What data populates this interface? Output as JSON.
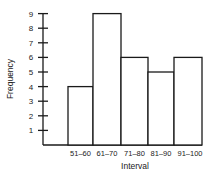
{
  "chart_data": {
    "type": "bar",
    "title": "",
    "xlabel": "Interval",
    "ylabel": "Frequency",
    "categories": [
      "51–60",
      "61–70",
      "71–80",
      "81–90",
      "91–100"
    ],
    "values": [
      4,
      9,
      6,
      5,
      6
    ],
    "yticks": [
      "1",
      "2",
      "3",
      "4",
      "5",
      "6",
      "7",
      "8",
      "9"
    ],
    "ylim": [
      0,
      9
    ],
    "grid": false,
    "legend": null,
    "histogram": true,
    "colors": {
      "bar_fill": "#ffffff",
      "bar_stroke": "#1a1a1a",
      "axis": "#1a1a1a"
    }
  }
}
